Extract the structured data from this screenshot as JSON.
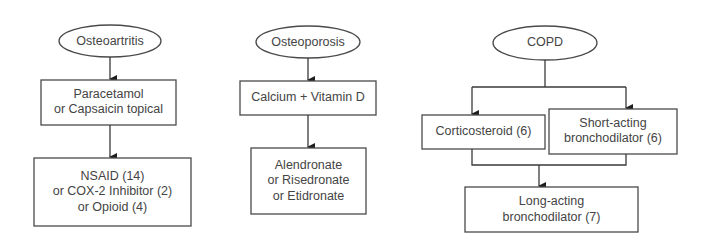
{
  "diagram": {
    "type": "flowchart",
    "colors": {
      "background": "#ffffff",
      "stroke": "#4a4a4a",
      "text": "#444444"
    },
    "flows": [
      {
        "id": "osteoarthritis",
        "start": {
          "label": "Osteoartritis"
        },
        "steps": [
          {
            "lines": [
              "Paracetamol",
              "or Capsaicin topical"
            ]
          },
          {
            "lines": [
              "NSAID (14)",
              "or COX-2 Inhibitor (2)",
              "or Opioid (4)"
            ]
          }
        ]
      },
      {
        "id": "osteoporosis",
        "start": {
          "label": "Osteoporosis"
        },
        "steps": [
          {
            "lines": [
              "Calcium + Vitamin D"
            ]
          },
          {
            "lines": [
              "Alendronate",
              "or Risedronate",
              "or Etidronate"
            ]
          }
        ]
      },
      {
        "id": "copd",
        "start": {
          "label": "COPD"
        },
        "branches": [
          {
            "lines": [
              "Corticosteroid (6)"
            ]
          },
          {
            "lines": [
              "Short-acting",
              "bronchodilator (6)"
            ]
          }
        ],
        "merge": {
          "lines": [
            "Long-acting",
            "bronchodilator (7)"
          ]
        }
      }
    ]
  }
}
